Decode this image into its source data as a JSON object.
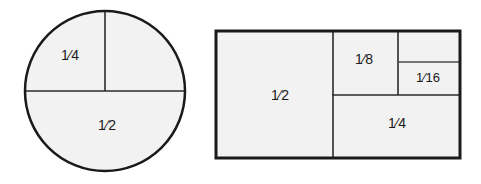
{
  "figure": {
    "background_color": "#ffffff",
    "fill_color": "#f2f2f2",
    "stroke_color": "#1a1a1a"
  },
  "circle_diagram": {
    "name": "circle-fraction-diagram",
    "center_x": 105,
    "center_y": 91,
    "radius": 80,
    "outer_stroke_width": 2.5,
    "divider_stroke_width": 1.6,
    "labels": [
      {
        "text": "1⁄4",
        "numerator": "1",
        "denominator": "4",
        "x": 70,
        "y": 56,
        "region": "upper-left-quadrant"
      },
      {
        "text": "1⁄2",
        "numerator": "1",
        "denominator": "2",
        "x": 107,
        "y": 126,
        "region": "lower-half"
      }
    ],
    "unlabeled_regions": [
      "upper-right-quadrant"
    ],
    "dividers": [
      {
        "type": "horizontal-diameter",
        "x1": 25,
        "y1": 91,
        "x2": 185,
        "y2": 91
      },
      {
        "type": "vertical-radius",
        "x1": 105,
        "y1": 11,
        "x2": 105,
        "y2": 91
      }
    ]
  },
  "rectangle_diagram": {
    "name": "rectangle-fraction-diagram",
    "x": 216,
    "y": 31,
    "width": 244,
    "height": 127,
    "outer_stroke_width": 3,
    "divider_stroke_width": 1.6,
    "cells": [
      {
        "label": "1⁄2",
        "numerator": "1",
        "denominator": "2",
        "x": 216,
        "y": 31,
        "w": 117,
        "h": 127,
        "cx": 280,
        "cy": 96
      },
      {
        "label": "1⁄4",
        "numerator": "1",
        "denominator": "4",
        "x": 333,
        "y": 95,
        "w": 127,
        "h": 63,
        "cx": 397,
        "cy": 124
      },
      {
        "label": "1⁄8",
        "numerator": "1",
        "denominator": "8",
        "x": 333,
        "y": 31,
        "w": 65,
        "h": 64,
        "cx": 364,
        "cy": 60
      },
      {
        "label": "1⁄16",
        "numerator": "1",
        "denominator": "16",
        "x": 398,
        "y": 62,
        "w": 62,
        "h": 33,
        "cx": 428,
        "cy": 79
      },
      {
        "label": "",
        "numerator": "",
        "denominator": "",
        "x": 398,
        "y": 31,
        "w": 62,
        "h": 31,
        "cx": 428,
        "cy": 46
      }
    ],
    "dividers": [
      {
        "type": "vertical",
        "x1": 333,
        "y1": 31,
        "x2": 333,
        "y2": 158
      },
      {
        "type": "horizontal",
        "x1": 333,
        "y1": 95,
        "x2": 460,
        "y2": 95
      },
      {
        "type": "vertical",
        "x1": 398,
        "y1": 31,
        "x2": 398,
        "y2": 95
      },
      {
        "type": "horizontal",
        "x1": 398,
        "y1": 62,
        "x2": 460,
        "y2": 62
      }
    ]
  }
}
